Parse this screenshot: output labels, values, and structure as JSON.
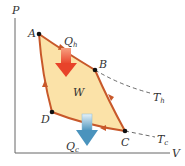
{
  "diagram": {
    "axes": {
      "y_label": "P",
      "x_label": "V"
    },
    "points": [
      {
        "name": "A"
      },
      {
        "name": "B"
      },
      {
        "name": "C"
      },
      {
        "name": "D"
      }
    ],
    "heat_in": {
      "symbol": "Q",
      "sub": "h"
    },
    "heat_out": {
      "symbol": "Q",
      "sub": "c"
    },
    "work": "W",
    "isotherm_hot": {
      "symbol": "T",
      "sub": "h"
    },
    "isotherm_cold": {
      "symbol": "T",
      "sub": "c"
    },
    "colors": {
      "cycle_fill": "#fbe2a8",
      "cycle_stroke": "#c8582a",
      "hot_arrow": "#e8432a",
      "cold_arrow": "#5aa3c8",
      "axis": "#555555"
    }
  }
}
